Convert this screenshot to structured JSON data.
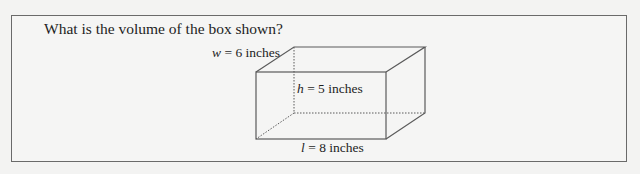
{
  "question": {
    "text": "What is the volume of the box shown?"
  },
  "figure": {
    "shape": "rectangular prism",
    "labels": {
      "width": {
        "var": "w",
        "rest": " = 6 inches"
      },
      "height": {
        "var": "h",
        "rest": " = 5 inches"
      },
      "length": {
        "var": "l",
        "rest": " = 8 inches"
      }
    },
    "colors": {
      "edge": "#5a5a5a",
      "frame": "#6a6a6a",
      "background": "#f5f5f4"
    }
  }
}
